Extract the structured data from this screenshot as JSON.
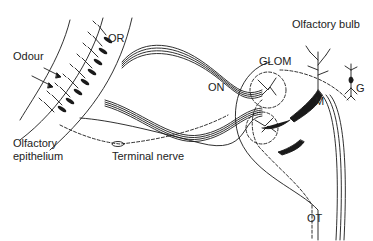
{
  "figure": {
    "type": "anatomical-diagram",
    "labels": {
      "olfactory_bulb": "Olfactory bulb",
      "odour": "Odour",
      "or": "OR",
      "on": "ON",
      "glom": "GLOM",
      "m": "M",
      "g": "G",
      "olfactory_epithelium_line1": "Olfactory",
      "olfactory_epithelium_line2": "epithelium",
      "terminal_nerve": "Terminal nerve",
      "ot": "OT"
    },
    "colors": {
      "ink": "#1a1a1a",
      "background": "#ffffff"
    }
  }
}
